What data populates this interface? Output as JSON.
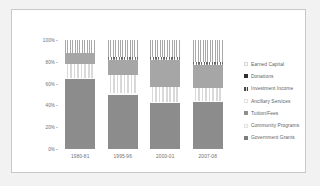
{
  "chart_data": {
    "type": "bar",
    "stacked": true,
    "normalized_percent": true,
    "title": "",
    "subtitle": "",
    "xlabel": "",
    "ylabel": "",
    "categories": [
      "1980-81",
      "1995-96",
      "2000-01",
      "2007-08"
    ],
    "ytick_labels": [
      "0%",
      "20%",
      "40%",
      "60%",
      "80%",
      "100%"
    ],
    "ytick_values": [
      0,
      20,
      40,
      60,
      80,
      100
    ],
    "ylim": [
      0,
      100
    ],
    "grid": false,
    "legend_position": "right",
    "series": [
      {
        "name": "Government Grants",
        "key": "gov",
        "values": [
          64,
          50,
          42,
          43
        ]
      },
      {
        "name": "Community Programs",
        "key": "comm",
        "values": [
          1,
          1,
          1,
          1
        ]
      },
      {
        "name": "Tuition/Fees",
        "key": "tuit",
        "values": [
          13,
          17,
          14,
          12
        ]
      },
      {
        "name": "Ancillary Services",
        "key": "anc",
        "values": [
          0,
          0,
          0,
          0
        ]
      },
      {
        "name": "Investment Income",
        "key": "inv",
        "values": [
          10,
          14,
          25,
          21
        ]
      },
      {
        "name": "Donations",
        "key": "don",
        "values": [
          0,
          2,
          2,
          3
        ]
      },
      {
        "name": "Earned Capital",
        "key": "earn",
        "values": [
          12,
          16,
          16,
          20
        ]
      }
    ]
  },
  "legend": {
    "items": [
      {
        "label": "Earned Capital",
        "key": "earn"
      },
      {
        "label": "Donations",
        "key": "don"
      },
      {
        "label": "Investment Income",
        "key": "inv"
      },
      {
        "label": "Ancillary Services",
        "key": "anc"
      },
      {
        "label": "Tuition/Fees",
        "key": "tuit"
      },
      {
        "label": "Community Programs",
        "key": "comm"
      },
      {
        "label": "Government Grants",
        "key": "gov"
      }
    ]
  },
  "colors": {
    "government_grants": "#8c8c8c",
    "investment_income": "#a6a6a6",
    "donations": "#3a3a3a",
    "page_background": "#f2f2f2",
    "card_background": "#ffffff",
    "card_border": "#c8c8c8",
    "axis_text": "#6d6d6d",
    "legend_text": "#5f5f5f"
  }
}
